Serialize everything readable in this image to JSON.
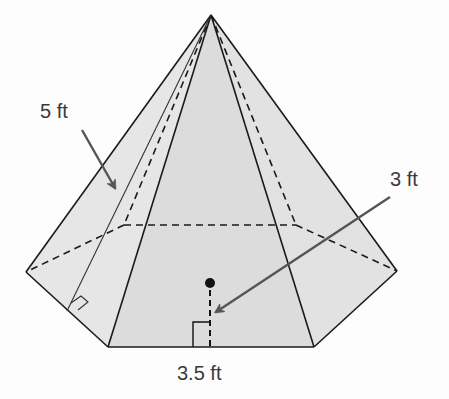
{
  "figure": {
    "type": "regular hexagonal pyramid",
    "labels": {
      "slant_height": "5 ft",
      "apothem": "3 ft",
      "base_edge": "3.5 ft"
    },
    "colors": {
      "face_fill": "#e3e3e3",
      "front_face_fill": "#dadada",
      "edge": "#1a1a1a",
      "arrow": "#555555",
      "label": "#3a3a3a"
    }
  }
}
